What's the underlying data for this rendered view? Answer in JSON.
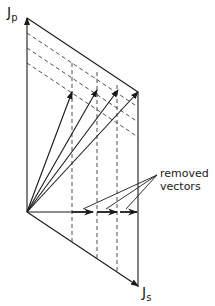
{
  "diagram": {
    "type": "vector-decomposition",
    "axes": {
      "vertical": {
        "symbol": "J",
        "subscript": "p"
      },
      "horizontal": {
        "symbol": "J",
        "subscript": "s"
      }
    },
    "annotation": {
      "line1": "removed",
      "line2": "vectors"
    },
    "geometry": {
      "origin": [
        27,
        212
      ],
      "top_corner": [
        27,
        18
      ],
      "upper_right_corner": [
        138,
        92
      ],
      "lower_right_corner": [
        138,
        287
      ],
      "resultant_vector_tips": [
        [
          72,
          92
        ],
        [
          97,
          90
        ],
        [
          118,
          90
        ],
        [
          138,
          92
        ]
      ],
      "removed_vector_segments": [
        [
          [
            72,
            212
          ],
          [
            93,
            212
          ]
        ],
        [
          [
            97,
            212
          ],
          [
            117,
            212
          ]
        ],
        [
          [
            120,
            212
          ],
          [
            137,
            212
          ]
        ]
      ],
      "slanted_dashed_lines_start_y": [
        33,
        48,
        63
      ],
      "vertical_dashed_lines_x": [
        72,
        97,
        117
      ]
    },
    "colors": {
      "ink": "#1a1a1a",
      "background": "#ffffff"
    }
  }
}
